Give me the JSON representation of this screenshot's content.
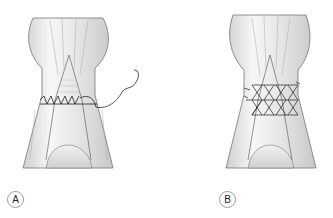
{
  "figure": {
    "panels": [
      {
        "id": "A",
        "label": "A",
        "description": "running locking circumferential suture with needle"
      },
      {
        "id": "B",
        "label": "B",
        "description": "cross-stitch (X) epitendinous suture"
      }
    ]
  },
  "colors": {
    "outline": "#555555",
    "shade": "#d8d8d8",
    "suture": "#222222",
    "background": "#ffffff"
  }
}
